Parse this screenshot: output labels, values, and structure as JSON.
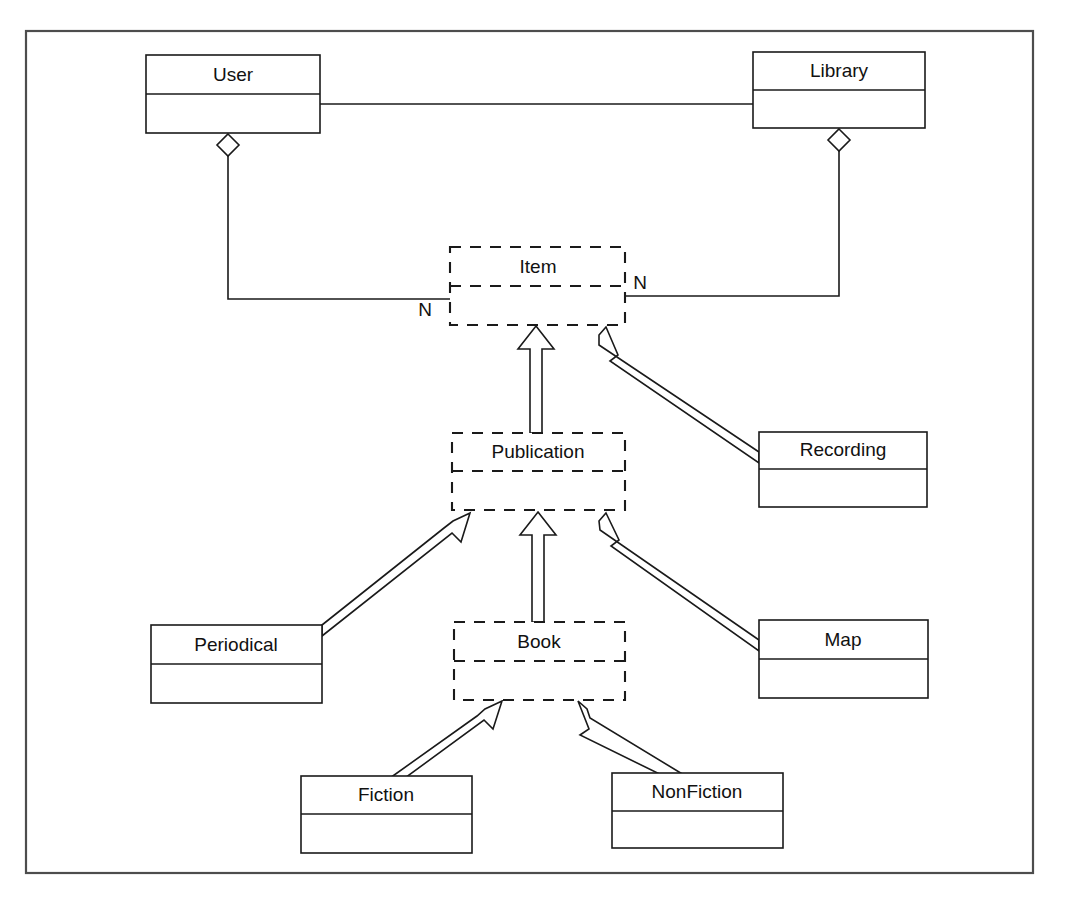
{
  "diagram": {
    "kind": "uml-class-diagram",
    "frame": {
      "x": 26,
      "y": 31,
      "width": 1007,
      "height": 842,
      "color": "#4d4d4d"
    },
    "colors": {
      "stroke": "#1a1a1a",
      "fill": "#ffffff",
      "frame": "#4d4d4d",
      "text": "#111111"
    },
    "classes": [
      {
        "id": "user",
        "name": "User",
        "style": "solid",
        "x": 146,
        "y": 55,
        "width": 174,
        "height": 78,
        "header_height": 39
      },
      {
        "id": "library",
        "name": "Library",
        "style": "solid",
        "x": 753,
        "y": 52,
        "width": 172,
        "height": 76,
        "header_height": 38
      },
      {
        "id": "item",
        "name": "Item",
        "style": "dashed",
        "x": 450,
        "y": 247,
        "width": 175,
        "height": 78,
        "header_height": 39
      },
      {
        "id": "publication",
        "name": "Publication",
        "style": "dashed",
        "x": 452,
        "y": 433,
        "width": 173,
        "height": 77,
        "header_height": 38
      },
      {
        "id": "recording",
        "name": "Recording",
        "style": "solid",
        "x": 759,
        "y": 432,
        "width": 168,
        "height": 75,
        "header_height": 37
      },
      {
        "id": "book",
        "name": "Book",
        "style": "dashed",
        "x": 454,
        "y": 622,
        "width": 171,
        "height": 78,
        "header_height": 39
      },
      {
        "id": "periodical",
        "name": "Periodical",
        "style": "solid",
        "x": 151,
        "y": 625,
        "width": 171,
        "height": 78,
        "header_height": 39
      },
      {
        "id": "map",
        "name": "Map",
        "style": "solid",
        "x": 759,
        "y": 620,
        "width": 169,
        "height": 78,
        "header_height": 39
      },
      {
        "id": "fiction",
        "name": "Fiction",
        "style": "solid",
        "x": 301,
        "y": 776,
        "width": 171,
        "height": 77,
        "header_height": 38
      },
      {
        "id": "nonfiction",
        "name": "NonFiction",
        "style": "solid",
        "x": 612,
        "y": 773,
        "width": 171,
        "height": 75,
        "header_height": 38
      }
    ],
    "associations": [
      {
        "id": "user-library",
        "from": "user",
        "to": "library",
        "type": "association",
        "label": ""
      },
      {
        "id": "user-item",
        "from": "user",
        "to": "item",
        "type": "aggregation",
        "label": "N",
        "label_x": 425,
        "label_y": 310
      },
      {
        "id": "library-item",
        "from": "library",
        "to": "item",
        "type": "aggregation",
        "label": "N",
        "label_x": 639,
        "label_y": 283
      }
    ],
    "generalizations": [
      {
        "id": "publication-item",
        "from": "publication",
        "to": "item",
        "type": "generalization"
      },
      {
        "id": "recording-item",
        "from": "recording",
        "to": "item",
        "type": "generalization"
      },
      {
        "id": "periodical-publication",
        "from": "periodical",
        "to": "publication",
        "type": "generalization"
      },
      {
        "id": "book-publication",
        "from": "book",
        "to": "publication",
        "type": "generalization"
      },
      {
        "id": "map-publication",
        "from": "map",
        "to": "publication",
        "type": "generalization"
      },
      {
        "id": "fiction-book",
        "from": "fiction",
        "to": "book",
        "type": "generalization"
      },
      {
        "id": "nonfiction-book",
        "from": "nonfiction",
        "to": "book",
        "type": "generalization"
      }
    ]
  }
}
